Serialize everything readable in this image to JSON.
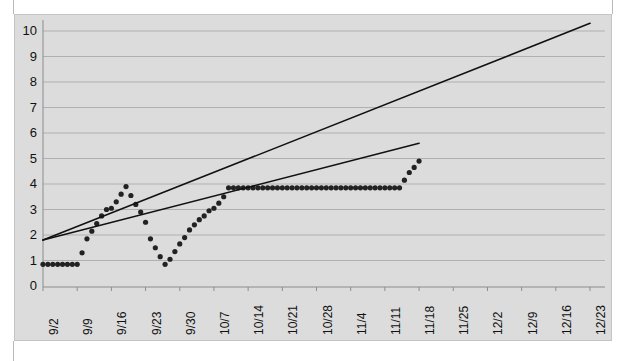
{
  "chart_data": {
    "type": "scatter",
    "title": "",
    "xlabel": "",
    "ylabel": "",
    "ylim": [
      0,
      10
    ],
    "y_ticks": [
      0,
      1,
      2,
      3,
      4,
      5,
      6,
      7,
      8,
      9,
      10
    ],
    "y_tick_labels": [
      "0",
      "1",
      "2",
      "3",
      "4",
      "5",
      "6",
      "7",
      "8",
      "9",
      "10"
    ],
    "grid": true,
    "legend": "none",
    "categories": [
      "9/2",
      "9/9",
      "9/16",
      "9/23",
      "9/30",
      "10/7",
      "10/14",
      "10/21",
      "10/28",
      "11/4",
      "11/11",
      "11/18",
      "11/25",
      "12/2",
      "12/9",
      "12/16",
      "12/23"
    ],
    "x_tick_labels": [
      "9/2",
      "9/9",
      "9/16",
      "9/23",
      "9/30",
      "10/7",
      "10/14",
      "10/21",
      "10/28",
      "11/4",
      "11/11",
      "11/18",
      "11/25",
      "12/2",
      "12/9",
      "12/16",
      "12/23"
    ],
    "x_axis_start": "9/2",
    "x_axis_end": "12/23",
    "series": [
      {
        "name": "data-points",
        "style": "dotted-markers",
        "color": "#222222",
        "marker": "circle",
        "x": [
          "9/2",
          "9/3",
          "9/4",
          "9/5",
          "9/6",
          "9/7",
          "9/8",
          "9/9",
          "9/10",
          "9/11",
          "9/12",
          "9/13",
          "9/14",
          "9/15",
          "9/16",
          "9/17",
          "9/18",
          "9/19",
          "9/20",
          "9/21",
          "9/22",
          "9/23",
          "9/24",
          "9/25",
          "9/26",
          "9/27",
          "9/28",
          "9/29",
          "9/30",
          "10/1",
          "10/2",
          "10/3",
          "10/4",
          "10/5",
          "10/6",
          "10/7",
          "10/8",
          "10/9",
          "10/10",
          "10/11",
          "10/12",
          "10/13",
          "10/14",
          "10/15",
          "10/16",
          "10/17",
          "10/18",
          "10/19",
          "10/20",
          "10/21",
          "10/22",
          "10/23",
          "10/24",
          "10/25",
          "10/26",
          "10/27",
          "10/28",
          "10/29",
          "10/30",
          "10/31",
          "11/1",
          "11/2",
          "11/3",
          "11/4",
          "11/5",
          "11/6",
          "11/7",
          "11/8",
          "11/9",
          "11/10",
          "11/11",
          "11/12",
          "11/13",
          "11/14",
          "11/15",
          "11/16",
          "11/17",
          "11/18"
        ],
        "y": [
          0.85,
          0.85,
          0.85,
          0.85,
          0.85,
          0.85,
          0.85,
          0.85,
          1.3,
          1.85,
          2.15,
          2.45,
          2.75,
          3.0,
          3.05,
          3.3,
          3.6,
          3.9,
          3.55,
          3.2,
          2.9,
          2.5,
          1.85,
          1.5,
          1.15,
          0.85,
          1.05,
          1.35,
          1.65,
          1.9,
          2.2,
          2.4,
          2.6,
          2.75,
          2.95,
          3.05,
          3.25,
          3.5,
          3.85,
          3.85,
          3.85,
          3.85,
          3.85,
          3.85,
          3.85,
          3.85,
          3.85,
          3.85,
          3.85,
          3.85,
          3.85,
          3.85,
          3.85,
          3.85,
          3.85,
          3.85,
          3.85,
          3.85,
          3.85,
          3.85,
          3.85,
          3.85,
          3.85,
          3.85,
          3.85,
          3.85,
          3.85,
          3.85,
          3.85,
          3.85,
          3.85,
          3.85,
          3.85,
          3.85,
          4.15,
          4.45,
          4.65,
          4.9
        ]
      },
      {
        "name": "trendline-steep",
        "style": "solid-line",
        "color": "#111111",
        "x_start": "9/2",
        "y_start": 1.8,
        "x_end": "12/23",
        "y_end": 10.3
      },
      {
        "name": "trendline-shallow",
        "style": "solid-line",
        "color": "#111111",
        "x_start": "9/2",
        "y_start": 1.8,
        "x_end": "11/18",
        "y_end": 5.6
      }
    ],
    "colors": {
      "panel_background": "#dcdcdc",
      "plot_background": "#dcdcdc",
      "gridline": "#b0b0b0",
      "axis": "#8c8c8c",
      "marker": "#222222",
      "trendline": "#111111",
      "page_background": "#ffffff",
      "guide_line": "#b9b9b9"
    }
  }
}
